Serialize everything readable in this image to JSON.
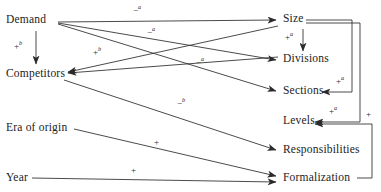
{
  "diagram": {
    "type": "causal-path-diagram",
    "width": 381,
    "height": 192,
    "background_color": "#ffffff",
    "line_color": "#2b2b2b",
    "text_color": "#1b1b1b",
    "nodes": [
      {
        "id": "demand",
        "label": "Demand",
        "x": 6,
        "y": 19
      },
      {
        "id": "competitors",
        "label": "Competitors",
        "x": 6,
        "y": 73
      },
      {
        "id": "era_of_origin",
        "label": "Era of origin",
        "x": 6,
        "y": 127
      },
      {
        "id": "year",
        "label": "Year",
        "x": 6,
        "y": 173
      },
      {
        "id": "size",
        "label": "Size",
        "x": 283,
        "y": 19
      },
      {
        "id": "divisions",
        "label": "Divisions",
        "x": 283,
        "y": 59
      },
      {
        "id": "sections",
        "label": "Sections",
        "x": 283,
        "y": 90
      },
      {
        "id": "levels",
        "label": "Levels",
        "x": 283,
        "y": 120
      },
      {
        "id": "responsibilities",
        "label": "Responsibilities",
        "x": 283,
        "y": 150
      },
      {
        "id": "formalization",
        "label": "Formalization",
        "x": 283,
        "y": 177
      }
    ],
    "edges": [
      {
        "id": "demand-size",
        "from": "demand",
        "to": "size",
        "sign": "-",
        "superscript": "a"
      },
      {
        "id": "demand-divisions",
        "from": "demand",
        "to": "divisions",
        "sign": "-",
        "superscript": "a"
      },
      {
        "id": "demand-sections",
        "from": "demand",
        "to": "sections",
        "sign": "-",
        "superscript": "a"
      },
      {
        "id": "demand-competitors",
        "from": "demand",
        "to": "competitors",
        "sign": "+",
        "superscript": "b"
      },
      {
        "id": "size-competitors",
        "from": "size",
        "to": "competitors",
        "sign": "+",
        "superscript": "b"
      },
      {
        "id": "competitors-responsibilities",
        "from": "competitors",
        "to": "responsibilities",
        "sign": "-",
        "superscript": "b"
      },
      {
        "id": "era-formalization",
        "from": "era_of_origin",
        "to": "formalization",
        "sign": "+",
        "superscript": ""
      },
      {
        "id": "year-formalization",
        "from": "year",
        "to": "formalization",
        "sign": "+",
        "superscript": ""
      },
      {
        "id": "size-divisions",
        "from": "size",
        "to": "divisions",
        "sign": "+",
        "superscript": "a"
      },
      {
        "id": "size-sections",
        "from": "size",
        "to": "sections",
        "sign": "+",
        "superscript": "a"
      },
      {
        "id": "size-levels",
        "from": "size",
        "to": "levels",
        "sign": "+",
        "superscript": "a"
      },
      {
        "id": "formalization-levels",
        "from": "formalization",
        "to": "levels",
        "sign": "+",
        "superscript": ""
      }
    ],
    "edge_labels": [
      {
        "id": "label-demand-size",
        "sign": "−",
        "superscript": "a",
        "x": 133,
        "y": 6
      },
      {
        "id": "label-demand-divisions",
        "sign": "−",
        "superscript": "a",
        "x": 147,
        "y": 28
      },
      {
        "id": "label-demand-competitors",
        "sign": "+",
        "superscript": "b",
        "x": 14,
        "y": 42
      },
      {
        "id": "label-size-competitors",
        "sign": "+",
        "superscript": "b",
        "x": 93,
        "y": 48
      },
      {
        "id": "label-demand-sections",
        "sign": "−",
        "superscript": "a",
        "x": 196,
        "y": 58
      },
      {
        "id": "label-comp-resp",
        "sign": "−",
        "superscript": "b",
        "x": 177,
        "y": 99
      },
      {
        "id": "label-size-divisions",
        "sign": "+",
        "superscript": "a",
        "x": 285,
        "y": 33
      },
      {
        "id": "label-size-sections",
        "sign": "+",
        "superscript": "a",
        "x": 336,
        "y": 77
      },
      {
        "id": "label-size-levels",
        "sign": "+",
        "superscript": "a",
        "x": 329,
        "y": 107
      },
      {
        "id": "label-formalization-levels",
        "sign": "+",
        "superscript": "",
        "x": 366,
        "y": 110
      },
      {
        "id": "label-era-formalization",
        "sign": "+",
        "superscript": "",
        "x": 154,
        "y": 138
      },
      {
        "id": "label-year-formalization",
        "sign": "+",
        "superscript": "",
        "x": 131,
        "y": 166
      }
    ]
  }
}
